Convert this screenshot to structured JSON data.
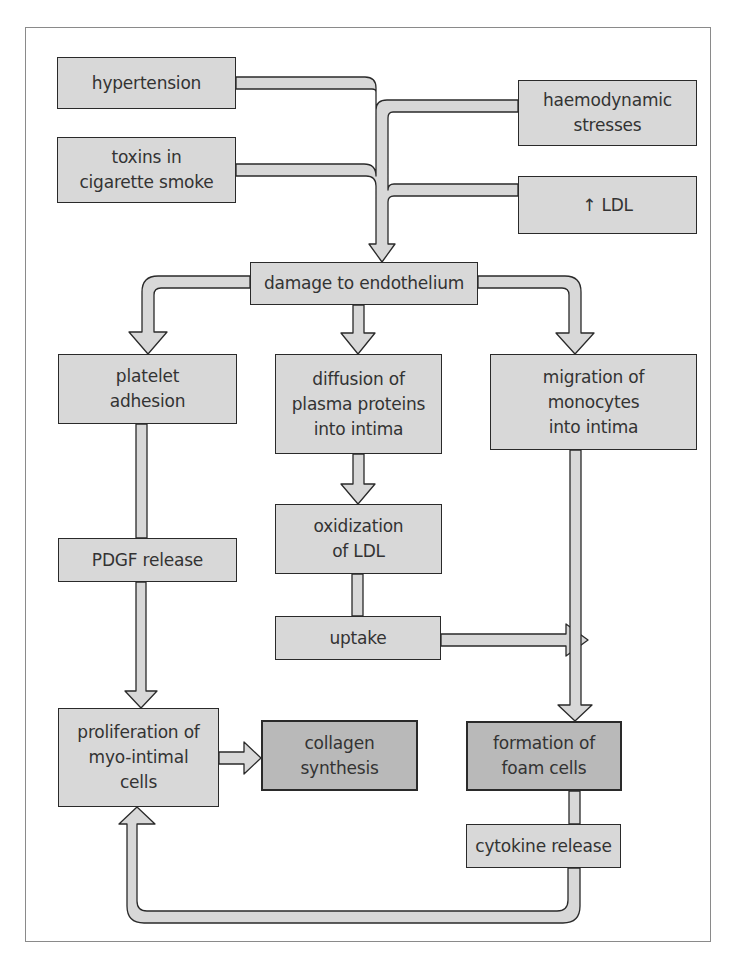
{
  "diagram": {
    "type": "flowchart",
    "colors": {
      "box_fill": "#d8d8d8",
      "box_fill_dark": "#b9b9b9",
      "border": "#2a2a2a",
      "arrow_fill": "#d8d8d8"
    },
    "nodes": {
      "hypertension": "hypertension",
      "haemodynamic_stresses": "haemodynamic\nstresses",
      "toxins": "toxins in\ncigarette smoke",
      "ldl": "↑ LDL",
      "damage": "damage to endothelium",
      "platelet": "platelet\nadhesion",
      "diffusion": "diffusion of\nplasma proteins\ninto intima",
      "migration": "migration of\nmonocytes\ninto intima",
      "oxidization": "oxidization\nof LDL",
      "pdgf": "PDGF release",
      "uptake": "uptake",
      "proliferation": "proliferation of\nmyo-intimal\ncells",
      "collagen": "collagen synthesis",
      "foam": "formation of\nfoam cells",
      "cytokine": "cytokine release"
    },
    "edges": [
      [
        "hypertension",
        "damage"
      ],
      [
        "haemodynamic_stresses",
        "damage"
      ],
      [
        "toxins",
        "damage"
      ],
      [
        "ldl",
        "damage"
      ],
      [
        "damage",
        "platelet"
      ],
      [
        "damage",
        "diffusion"
      ],
      [
        "damage",
        "migration"
      ],
      [
        "diffusion",
        "oxidization"
      ],
      [
        "oxidization",
        "uptake"
      ],
      [
        "uptake",
        "foam"
      ],
      [
        "platelet",
        "pdgf"
      ],
      [
        "pdgf",
        "proliferation"
      ],
      [
        "migration",
        "foam"
      ],
      [
        "proliferation",
        "collagen"
      ],
      [
        "foam",
        "cytokine"
      ],
      [
        "cytokine",
        "proliferation"
      ]
    ]
  }
}
